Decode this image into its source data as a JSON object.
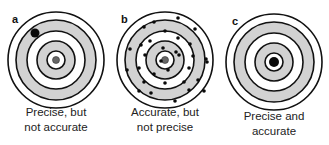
{
  "figure": {
    "colors": {
      "ring_line": "#111111",
      "ring_gray": "#d2d2d2",
      "ring_white": "#ffffff",
      "center_dot_gray": "#666666",
      "hit": "#0a0a0a"
    },
    "ring_radii": [
      48,
      40,
      29,
      19,
      9
    ],
    "ring_fills": [
      "white",
      "gray",
      "white",
      "gray",
      "white"
    ],
    "panels": [
      {
        "letter": "a",
        "caption_line1": "Precise, but",
        "caption_line2": "not accurate",
        "center": [
          56,
          60
        ],
        "center_dot": true,
        "hits": [
          {
            "x": 35,
            "y": 33,
            "r": 4.5
          }
        ]
      },
      {
        "letter": "b",
        "caption_line1": "Accurate, but",
        "caption_line2": "not precise",
        "center": [
          165,
          60
        ],
        "center_dot": true,
        "hits": [
          {
            "x": 144,
            "y": 27,
            "r": 1.8
          },
          {
            "x": 154,
            "y": 22,
            "r": 1.8
          },
          {
            "x": 165,
            "y": 31,
            "r": 1.8
          },
          {
            "x": 150,
            "y": 41,
            "r": 1.8
          },
          {
            "x": 141,
            "y": 45,
            "r": 1.8
          },
          {
            "x": 130,
            "y": 49,
            "r": 1.8
          },
          {
            "x": 145,
            "y": 55,
            "r": 1.8
          },
          {
            "x": 178,
            "y": 18,
            "r": 1.8
          },
          {
            "x": 195,
            "y": 29,
            "r": 1.8
          },
          {
            "x": 178,
            "y": 38,
            "r": 1.8
          },
          {
            "x": 190,
            "y": 44,
            "r": 1.8
          },
          {
            "x": 179,
            "y": 55,
            "r": 1.8
          },
          {
            "x": 193,
            "y": 56,
            "r": 1.8
          },
          {
            "x": 206,
            "y": 59,
            "r": 1.8
          },
          {
            "x": 127,
            "y": 70,
            "r": 1.8
          },
          {
            "x": 139,
            "y": 68,
            "r": 1.8
          },
          {
            "x": 154,
            "y": 74,
            "r": 1.8
          },
          {
            "x": 144,
            "y": 82,
            "r": 1.8
          },
          {
            "x": 165,
            "y": 83,
            "r": 1.8
          },
          {
            "x": 139,
            "y": 91,
            "r": 1.8
          },
          {
            "x": 151,
            "y": 93,
            "r": 1.8
          },
          {
            "x": 207,
            "y": 62,
            "r": 1.8
          },
          {
            "x": 189,
            "y": 68,
            "r": 1.8
          },
          {
            "x": 184,
            "y": 82,
            "r": 1.8
          },
          {
            "x": 198,
            "y": 80,
            "r": 1.8
          },
          {
            "x": 189,
            "y": 90,
            "r": 1.8
          },
          {
            "x": 204,
            "y": 91,
            "r": 1.8
          },
          {
            "x": 175,
            "y": 101,
            "r": 1.8
          },
          {
            "x": 163,
            "y": 48,
            "r": 1.8
          },
          {
            "x": 176,
            "y": 52,
            "r": 1.8
          },
          {
            "x": 161,
            "y": 61,
            "r": 1.8
          },
          {
            "x": 168,
            "y": 70,
            "r": 1.8
          }
        ]
      },
      {
        "letter": "c",
        "caption_line1": "Precise and",
        "caption_line2": "accurate",
        "center": [
          274,
          62
        ],
        "center_dot": false,
        "hits": [
          {
            "x": 274,
            "y": 62,
            "r": 5
          }
        ]
      }
    ]
  }
}
